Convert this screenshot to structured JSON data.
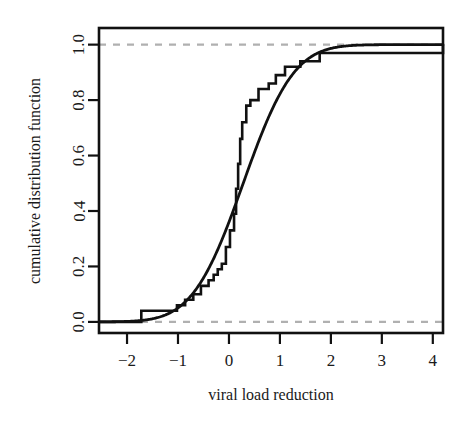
{
  "chart_data": {
    "type": "line",
    "title": "",
    "subtitle": "",
    "xlabel": "viral load reduction",
    "ylabel": "cumulative distribution function",
    "xlim": [
      -2.55,
      4.2
    ],
    "ylim": [
      -0.04,
      1.06
    ],
    "xticks": [
      -2,
      -1,
      0,
      1,
      2,
      3,
      4
    ],
    "xticklabels": [
      "−2",
      "−1",
      "0",
      "1",
      "2",
      "3",
      "4"
    ],
    "yticks": [
      0.0,
      0.2,
      0.4,
      0.6,
      0.8,
      1.0
    ],
    "yticklabels": [
      "0.0",
      "0.2",
      "0.4",
      "0.6",
      "0.8",
      "1.0"
    ],
    "grid": false,
    "legend": "none",
    "annotations": [],
    "reference_lines": [
      {
        "name": "lower-bound",
        "orientation": "horizontal",
        "y": 0.0,
        "style": "dashed",
        "color": "#b0b0b0"
      },
      {
        "name": "upper-bound",
        "orientation": "horizontal",
        "y": 1.0,
        "style": "dashed",
        "color": "#b0b0b0"
      }
    ],
    "series": [
      {
        "name": "empirical cumulative distribution function",
        "type": "step",
        "style": "solid",
        "color": "#111111",
        "step_mode": "hv",
        "x": [
          -2.55,
          -1.78,
          -1.72,
          -1.2,
          -1.02,
          -0.86,
          -0.7,
          -0.55,
          -0.4,
          -0.3,
          -0.22,
          -0.14,
          -0.06,
          0.02,
          0.1,
          0.14,
          0.18,
          0.22,
          0.26,
          0.34,
          0.42,
          0.58,
          0.78,
          0.92,
          1.1,
          1.4,
          1.78,
          3.5,
          4.2
        ],
        "y": [
          0.0,
          0.0,
          0.04,
          0.04,
          0.06,
          0.08,
          0.1,
          0.13,
          0.15,
          0.17,
          0.19,
          0.21,
          0.27,
          0.33,
          0.39,
          0.48,
          0.57,
          0.66,
          0.72,
          0.78,
          0.8,
          0.84,
          0.86,
          0.89,
          0.92,
          0.94,
          0.97,
          0.97,
          1.0
        ]
      },
      {
        "name": "fitted normal cumulative distribution function",
        "type": "line",
        "style": "solid",
        "color": "#111111",
        "smooth": true,
        "mean": 0.28,
        "sd": 0.78,
        "x": [
          -2.55,
          -2.3,
          -2.0,
          -1.8,
          -1.6,
          -1.4,
          -1.2,
          -1.0,
          -0.8,
          -0.6,
          -0.4,
          -0.2,
          0.0,
          0.2,
          0.4,
          0.6,
          0.8,
          1.0,
          1.2,
          1.4,
          1.6,
          1.8,
          2.0,
          2.2,
          2.4,
          2.6,
          2.8,
          3.0,
          3.3,
          3.6,
          4.0,
          4.2
        ],
        "y": [
          0.0,
          0.001,
          0.002,
          0.004,
          0.008,
          0.014,
          0.025,
          0.042,
          0.069,
          0.107,
          0.159,
          0.227,
          0.36,
          0.46,
          0.56,
          0.66,
          0.75,
          0.82,
          0.876,
          0.918,
          0.948,
          0.968,
          0.981,
          0.989,
          0.994,
          0.997,
          0.998,
          0.999,
          1.0,
          1.0,
          1.0,
          1.0
        ]
      }
    ]
  },
  "axes": {
    "x_title": "viral load reduction",
    "y_title": "cumulative distribution function",
    "x_tick_labels": [
      "−2",
      "−1",
      "0",
      "1",
      "2",
      "3",
      "4"
    ],
    "y_tick_labels": [
      "0.0",
      "0.2",
      "0.4",
      "0.6",
      "0.8",
      "1.0"
    ]
  },
  "colors": {
    "line": "#111111",
    "reference": "#b0b0b0",
    "background": "#ffffff",
    "frame": "#111111"
  }
}
